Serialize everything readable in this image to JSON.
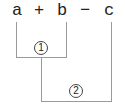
{
  "expression": {
    "tokens": [
      "a",
      "+",
      "b",
      "−",
      "c"
    ]
  },
  "steps": [
    {
      "label": "1",
      "spans": [
        "a",
        "b"
      ]
    },
    {
      "label": "2",
      "spans": [
        "result of 1",
        "c"
      ]
    }
  ],
  "colors": {
    "line": "#9a9a9a",
    "text": "#222222"
  }
}
